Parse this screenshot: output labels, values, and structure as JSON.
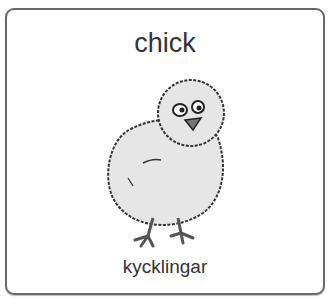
{
  "card": {
    "title": "chick",
    "caption": "kycklingar",
    "image": {
      "subject": "chick-illustration"
    }
  },
  "colors": {
    "border": "#6a6a6a",
    "text": "#333333",
    "body": "#e6e6e6",
    "beak": "#777777"
  }
}
